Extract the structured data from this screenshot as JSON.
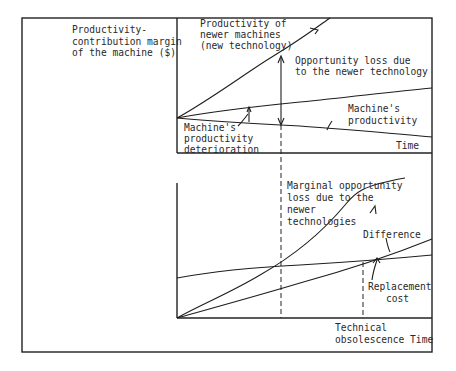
{
  "figure": {
    "y_axis_label": [
      "Productivity-",
      "contribution margin",
      "of the machine ($)"
    ],
    "top_panel": {
      "x_axis_label": "Time",
      "labels": {
        "newer_machines": [
          "Productivity of",
          "newer machines",
          "(new technology)"
        ],
        "opportunity_loss": [
          "Opportunity loss due",
          "to the newer technology"
        ],
        "machine_productivity": [
          "Machine's",
          "productivity"
        ],
        "deterioration": [
          "Machine's",
          "productivity",
          "deterioration"
        ]
      }
    },
    "bottom_panel": {
      "x_axis_label": [
        "Technical",
        "obsolescence Time"
      ],
      "labels": {
        "marginal_loss": [
          "Marginal opportunity",
          "loss due to the",
          "newer",
          "technologies"
        ],
        "difference": "Difference",
        "replacement_cost": [
          "Replacement",
          "cost"
        ]
      }
    }
  },
  "colors": {
    "ink": "#1e1e1e",
    "background": "#ffffff"
  }
}
